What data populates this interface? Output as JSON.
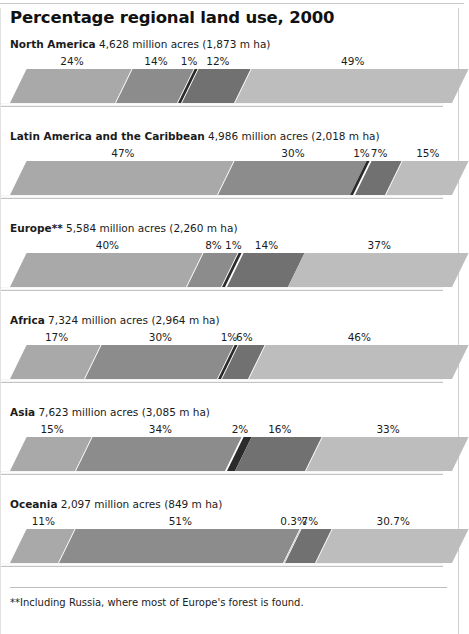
{
  "chart_title": "Percentage regional land use, 2000",
  "footnote": "**Including Russia, where most of Europe's forest is found.",
  "palette": {
    "forest": "#a9a9a9",
    "other_wooded": "#8c8c8c",
    "inland_water": "#2b2b2b",
    "cropland": "#717171",
    "other": "#bdbdbd"
  },
  "chart_data": {
    "type": "bar",
    "orientation": "horizontal-stacked",
    "title": "Percentage regional land use, 2000",
    "xlabel": "",
    "ylabel": "",
    "xlim": [
      0,
      100
    ],
    "grid": false,
    "legend": "none",
    "units_note": "Each bar totals 100% of regional land area; bar caption gives total land area in million acres and million hectares.",
    "categories": [
      "North America",
      "Latin America and the Caribbean",
      "Europe**",
      "Africa",
      "Asia",
      "Oceania"
    ],
    "series": [
      {
        "name": "segment-1",
        "values": [
          24,
          47,
          40,
          17,
          15,
          11
        ]
      },
      {
        "name": "segment-2",
        "values": [
          14,
          30,
          8,
          30,
          34,
          51
        ]
      },
      {
        "name": "segment-3",
        "values": [
          1,
          1,
          1,
          1,
          2,
          0.3
        ]
      },
      {
        "name": "segment-4",
        "values": [
          12,
          7,
          14,
          6,
          16,
          7
        ]
      },
      {
        "name": "segment-5",
        "values": [
          49,
          15,
          37,
          46,
          33,
          30.7
        ]
      }
    ],
    "annotations": [
      "**Including Russia, where most of Europe's forest is found."
    ]
  },
  "regions": [
    {
      "name": "North America",
      "stats": " 4,628 million acres (1,873 m ha)",
      "segments": [
        {
          "label": "24%",
          "value": 24,
          "color": "#a9a9a9"
        },
        {
          "label": "14%",
          "value": 14,
          "color": "#8c8c8c"
        },
        {
          "label": "1%",
          "value": 1,
          "color": "#2b2b2b"
        },
        {
          "label": "12%",
          "value": 12,
          "color": "#717171"
        },
        {
          "label": "49%",
          "value": 49,
          "color": "#bdbdbd"
        }
      ]
    },
    {
      "name": "Latin America and the Caribbean",
      "stats": " 4,986 million acres (2,018 m ha)",
      "segments": [
        {
          "label": "47%",
          "value": 47,
          "color": "#a9a9a9"
        },
        {
          "label": "30%",
          "value": 30,
          "color": "#8c8c8c"
        },
        {
          "label": "1%",
          "value": 1,
          "color": "#2b2b2b"
        },
        {
          "label": "7%",
          "value": 7,
          "color": "#717171"
        },
        {
          "label": "15%",
          "value": 15,
          "color": "#bdbdbd"
        }
      ]
    },
    {
      "name": "Europe**",
      "stats": " 5,584 million acres (2,260 m ha)",
      "segments": [
        {
          "label": "40%",
          "value": 40,
          "color": "#a9a9a9"
        },
        {
          "label": "8%",
          "value": 8,
          "color": "#8c8c8c"
        },
        {
          "label": "1%",
          "value": 1,
          "color": "#2b2b2b"
        },
        {
          "label": "14%",
          "value": 14,
          "color": "#717171"
        },
        {
          "label": "37%",
          "value": 37,
          "color": "#bdbdbd"
        }
      ]
    },
    {
      "name": "Africa",
      "stats": " 7,324 million acres (2,964 m ha)",
      "segments": [
        {
          "label": "17%",
          "value": 17,
          "color": "#a9a9a9"
        },
        {
          "label": "30%",
          "value": 30,
          "color": "#8c8c8c"
        },
        {
          "label": "1%",
          "value": 1,
          "color": "#2b2b2b"
        },
        {
          "label": "6%",
          "value": 6,
          "color": "#717171"
        },
        {
          "label": "46%",
          "value": 46,
          "color": "#bdbdbd"
        }
      ]
    },
    {
      "name": "Asia",
      "stats": " 7,623 million acres (3,085 m ha)",
      "segments": [
        {
          "label": "15%",
          "value": 15,
          "color": "#a9a9a9"
        },
        {
          "label": "34%",
          "value": 34,
          "color": "#8c8c8c"
        },
        {
          "label": "2%",
          "value": 2,
          "color": "#2b2b2b"
        },
        {
          "label": "16%",
          "value": 16,
          "color": "#717171"
        },
        {
          "label": "33%",
          "value": 33,
          "color": "#bdbdbd"
        }
      ]
    },
    {
      "name": "Oceania",
      "stats": " 2,097 million acres (849 m ha)",
      "segments": [
        {
          "label": "11%",
          "value": 11,
          "color": "#a9a9a9"
        },
        {
          "label": "51%",
          "value": 51,
          "color": "#8c8c8c"
        },
        {
          "label": "0.3%",
          "value": 0.3,
          "color": "#2b2b2b"
        },
        {
          "label": "7%",
          "value": 7,
          "color": "#717171"
        },
        {
          "label": "30.7%",
          "value": 30.7,
          "color": "#bdbdbd"
        }
      ]
    }
  ]
}
